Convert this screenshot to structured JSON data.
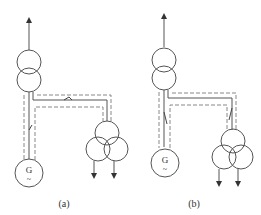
{
  "diagrams": [
    {
      "id": "a",
      "label": "(a)",
      "generator_symbol": "G",
      "generator_sub": "~"
    },
    {
      "id": "b",
      "label": "(b)",
      "generator_symbol": "G",
      "generator_sub": "~"
    }
  ],
  "colors": {
    "line": "#555555",
    "dash": "#888888"
  }
}
